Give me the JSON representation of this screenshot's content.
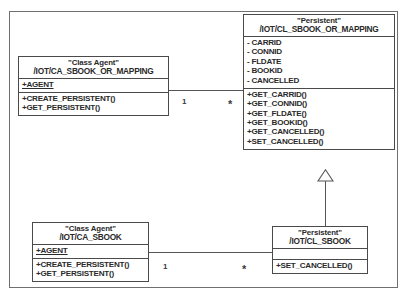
{
  "diagram": {
    "frame_label": "",
    "classes": [
      {
        "id": "ca-sbook-or-mapping",
        "stereotype": "\"Class Agent\"",
        "name": "/IOT/CA_SBOOK_OR_MAPPING",
        "attributes": [
          {
            "text": "+AGENT",
            "static": true
          }
        ],
        "operations": [
          {
            "text": "+CREATE_PERSISTENT()"
          },
          {
            "text": "+GET_PERSISTENT()"
          }
        ]
      },
      {
        "id": "cl-sbook-or-mapping",
        "stereotype": "\"Persistent\"",
        "name": "/IOT/CL_SBOOK_OR_MAPPING",
        "attributes": [
          {
            "text": "- CARRID",
            "static": false
          },
          {
            "text": "- CONNID",
            "static": false
          },
          {
            "text": "- FLDATE",
            "static": false
          },
          {
            "text": "- BOOKID",
            "static": false
          },
          {
            "text": "- CANCELLED",
            "static": false
          }
        ],
        "operations": [
          {
            "text": "+GET_CARRID()"
          },
          {
            "text": "+GET_CONNID()"
          },
          {
            "text": "+GET_FLDATE()"
          },
          {
            "text": "+GET_BOOKID()"
          },
          {
            "text": "+GET_CANCELLED()"
          },
          {
            "text": "+SET_CANCELLED()"
          }
        ]
      },
      {
        "id": "ca-sbook",
        "stereotype": "\"Class Agent\"",
        "name": "/IOT/CA_SBOOK",
        "attributes": [
          {
            "text": "+AGENT",
            "static": true
          }
        ],
        "operations": [
          {
            "text": "+CREATE_PERSISTENT()"
          },
          {
            "text": "+GET_PERSISTENT()"
          }
        ]
      },
      {
        "id": "cl-sbook",
        "stereotype": "\"Persistent\"",
        "name": "/IOT/CL_SBOOK",
        "attributes": [],
        "operations": [
          {
            "text": "+SET_CANCELLED()"
          }
        ]
      }
    ],
    "relationships": [
      {
        "id": "assoc-top",
        "type": "association",
        "source": "/IOT/CA_SBOOK_OR_MAPPING",
        "target": "/IOT/CL_SBOOK_OR_MAPPING",
        "source_multiplicity": "1",
        "target_multiplicity": "*"
      },
      {
        "id": "assoc-bottom",
        "type": "association",
        "source": "/IOT/CA_SBOOK",
        "target": "/IOT/CL_SBOOK",
        "source_multiplicity": "1",
        "target_multiplicity": "*"
      },
      {
        "id": "gen-sbook",
        "type": "generalization",
        "source": "/IOT/CL_SBOOK",
        "target": "/IOT/CL_SBOOK_OR_MAPPING",
        "source_multiplicity": "",
        "target_multiplicity": ""
      }
    ],
    "colors": {
      "frame_border": "#6f6f6f",
      "class_border": "#4a4a4a",
      "line": "#555555",
      "text": "#2a2a2a",
      "background": "#ffffff"
    }
  }
}
